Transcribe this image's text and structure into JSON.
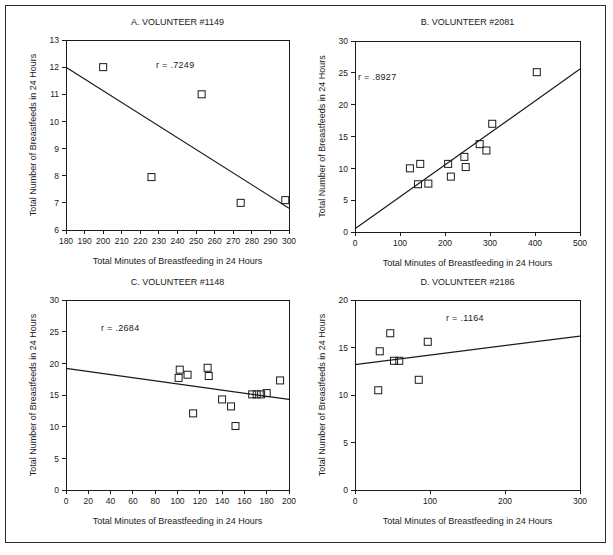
{
  "figure": {
    "axis_label_x": "Total Minutes of Breastfeeding in 24 Hours",
    "axis_label_y": "Total Number of Breastfeeds in 24 Hours",
    "marker_shape": "open-square",
    "line_color": "#1a1a1a",
    "marker_color": "#1a1a1a",
    "background": "#ffffff"
  },
  "chart_data": [
    {
      "type": "scatter",
      "panel": "A",
      "title": "A. VOLUNTEER #1149",
      "annotation": "r  =  .7249",
      "r": 0.7249,
      "xlabel": "Total Minutes of Breastfeeding in 24 Hours",
      "ylabel": "Total Number of Breastfeeds in 24 Hours",
      "xlim": [
        180,
        300
      ],
      "ylim": [
        6,
        13
      ],
      "xticks": [
        180,
        190,
        200,
        210,
        220,
        230,
        240,
        250,
        260,
        270,
        280,
        290,
        300
      ],
      "yticks": [
        6,
        7,
        8,
        9,
        10,
        11,
        12,
        13
      ],
      "grid": false,
      "points": [
        {
          "x": 200,
          "y": 12.0
        },
        {
          "x": 253,
          "y": 11.0
        },
        {
          "x": 226,
          "y": 7.95
        },
        {
          "x": 274,
          "y": 7.0
        },
        {
          "x": 298,
          "y": 7.1
        }
      ],
      "fit_line": {
        "x1": 180,
        "y1": 12.0,
        "x2": 300,
        "y2": 6.8
      }
    },
    {
      "type": "scatter",
      "panel": "B",
      "title": "B. VOLUNTEER #2081",
      "annotation": "r  =  .8927",
      "r": 0.8927,
      "xlabel": "Total Minutes of Breastfeeding in 24 Hours",
      "ylabel": "Total Number of Breastfeeds in 24 Hours",
      "xlim": [
        0,
        500
      ],
      "ylim": [
        0,
        30
      ],
      "xticks": [
        0,
        100,
        200,
        300,
        400,
        500
      ],
      "yticks": [
        0,
        5,
        10,
        15,
        20,
        25,
        30
      ],
      "grid": false,
      "points": [
        {
          "x": 122,
          "y": 10.0
        },
        {
          "x": 145,
          "y": 10.7
        },
        {
          "x": 140,
          "y": 7.5
        },
        {
          "x": 163,
          "y": 7.6
        },
        {
          "x": 207,
          "y": 10.7
        },
        {
          "x": 213,
          "y": 8.7
        },
        {
          "x": 243,
          "y": 11.8
        },
        {
          "x": 246,
          "y": 10.2
        },
        {
          "x": 277,
          "y": 13.8
        },
        {
          "x": 292,
          "y": 12.8
        },
        {
          "x": 305,
          "y": 17.0
        },
        {
          "x": 404,
          "y": 25.1
        }
      ],
      "fit_line": {
        "x1": 0,
        "y1": 0.5,
        "x2": 500,
        "y2": 25.6
      }
    },
    {
      "type": "scatter",
      "panel": "C",
      "title": "C. VOLUNTEER #1148",
      "annotation": "r  =  .2684",
      "r": 0.2684,
      "xlabel": "Total Minutes of Breastfeeding in 24 Hours",
      "ylabel": "Total Number of Breastfeeds in 24 Hours",
      "xlim": [
        0,
        200
      ],
      "ylim": [
        0,
        30
      ],
      "xticks": [
        0,
        20,
        40,
        60,
        80,
        100,
        120,
        140,
        160,
        180,
        200
      ],
      "yticks": [
        0,
        5,
        10,
        15,
        20,
        25,
        30
      ],
      "grid": false,
      "points": [
        {
          "x": 102,
          "y": 19.0
        },
        {
          "x": 101,
          "y": 17.7
        },
        {
          "x": 109,
          "y": 18.2
        },
        {
          "x": 127,
          "y": 19.3
        },
        {
          "x": 128,
          "y": 18.0
        },
        {
          "x": 114,
          "y": 12.1
        },
        {
          "x": 140,
          "y": 14.3
        },
        {
          "x": 148,
          "y": 13.2
        },
        {
          "x": 152,
          "y": 10.1
        },
        {
          "x": 167,
          "y": 15.1
        },
        {
          "x": 171,
          "y": 15.1
        },
        {
          "x": 175,
          "y": 15.1
        },
        {
          "x": 180,
          "y": 15.3
        },
        {
          "x": 192,
          "y": 17.3
        }
      ],
      "fit_line": {
        "x1": 0,
        "y1": 19.2,
        "x2": 200,
        "y2": 14.3
      }
    },
    {
      "type": "scatter",
      "panel": "D",
      "title": "D. VOLUNTEER #2186",
      "annotation": "r  =  .1164",
      "r": 0.1164,
      "xlabel": "Total Minutes of Breastfeeding in 24 Hours",
      "ylabel": "Total Number of Breastfeeds in 24 Hours",
      "xlim": [
        0,
        300
      ],
      "ylim": [
        0,
        20
      ],
      "xticks": [
        0,
        100,
        200,
        300
      ],
      "yticks": [
        0,
        5,
        10,
        15,
        20
      ],
      "grid": false,
      "points": [
        {
          "x": 33,
          "y": 14.6
        },
        {
          "x": 47,
          "y": 16.5
        },
        {
          "x": 52,
          "y": 13.6
        },
        {
          "x": 59,
          "y": 13.6
        },
        {
          "x": 97,
          "y": 15.6
        },
        {
          "x": 85,
          "y": 11.6
        },
        {
          "x": 31,
          "y": 10.5
        }
      ],
      "fit_line": {
        "x1": 0,
        "y1": 13.2,
        "x2": 300,
        "y2": 16.2
      }
    }
  ]
}
